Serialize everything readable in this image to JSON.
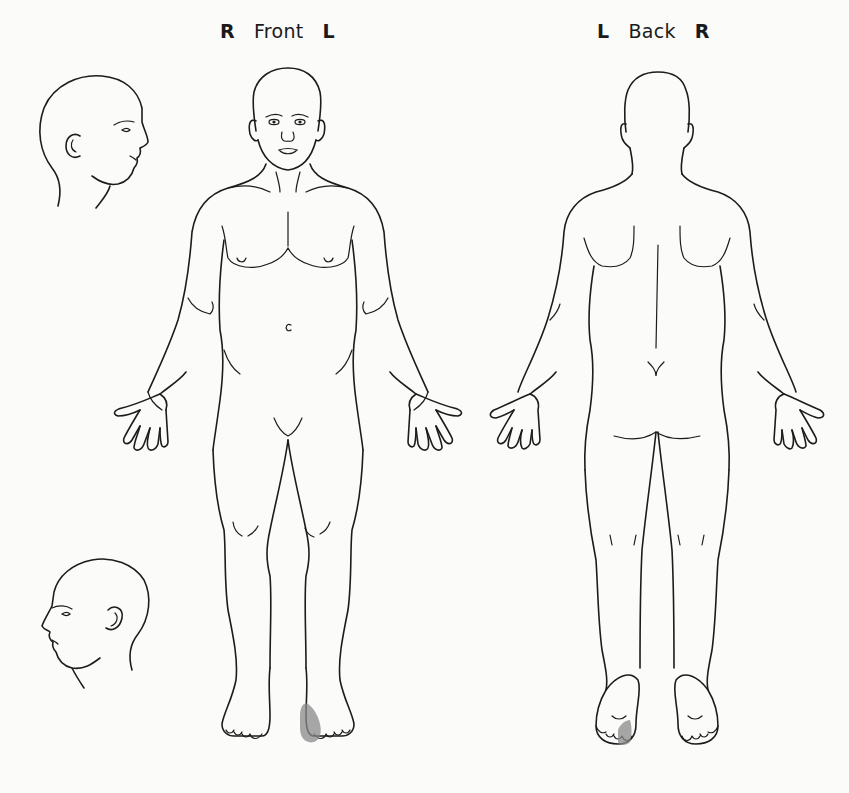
{
  "diagram": {
    "type": "body-pain-map",
    "views": [
      {
        "id": "front",
        "title": "Front",
        "left_side_label": "R",
        "right_side_label": "L"
      },
      {
        "id": "back",
        "title": "Back",
        "left_side_label": "L",
        "right_side_label": "R"
      }
    ],
    "head_profiles": [
      {
        "id": "head-right-profile",
        "facing": "right"
      },
      {
        "id": "head-left-profile",
        "facing": "left"
      }
    ],
    "marked_regions": [
      {
        "view": "front",
        "region": "left great toe / medial forefoot",
        "color": "#8a8a8a"
      },
      {
        "view": "back",
        "region": "left foot sole, medial forefoot / great toe",
        "color": "#8a8a8a"
      }
    ],
    "colors": {
      "line": "#1c1c1c",
      "shading": "#8a8a8a",
      "background": "#fbfbfa"
    }
  }
}
